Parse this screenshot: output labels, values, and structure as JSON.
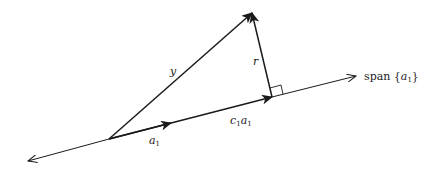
{
  "diagram": {
    "type": "vector-projection",
    "labels": {
      "y": "y",
      "r": "r",
      "a1_base": "a",
      "a1_sub": "1",
      "c1a1_c": "c",
      "c1a1_c_sub": "1",
      "c1a1_a": "a",
      "c1a1_a_sub": "1",
      "span_prefix": "span ",
      "span_open": "{",
      "span_var": "a",
      "span_sub": "1",
      "span_close": "}"
    },
    "elements": [
      {
        "name": "span-line",
        "description": "line spanned by a1, arrows both ends"
      },
      {
        "name": "vector-y",
        "description": "vector from origin to y"
      },
      {
        "name": "vector-a1",
        "description": "unit direction vector a1"
      },
      {
        "name": "vector-c1a1",
        "description": "projection of y onto span{a1}"
      },
      {
        "name": "vector-r",
        "description": "residual r = y - c1 a1, perpendicular to span"
      },
      {
        "name": "right-angle-marker",
        "description": "marks r perpendicular to span{a1}"
      }
    ],
    "colors": {
      "stroke": "#1a1a1a",
      "background": "#ffffff"
    }
  }
}
